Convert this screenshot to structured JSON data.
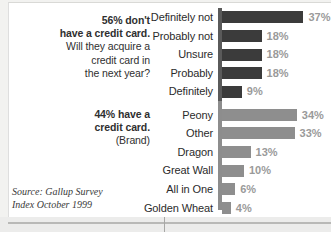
{
  "annotations": {
    "group1_line1": "56% don't",
    "group1_line2": "have a credit card.",
    "group1_line3": "Will they acquire a",
    "group1_line4": "credit card in",
    "group1_line5": "the next year?",
    "group2_line1": "44% have a",
    "group2_line2": "credit card.",
    "group2_line3": "(Brand)"
  },
  "source": {
    "line1": "Source: Gallup Survey",
    "line2": "Index October 1999"
  },
  "colors": {
    "bar_dark": "#3b3b3b",
    "bar_light": "#8e8e8e",
    "axis": "#8d8d8d",
    "value_label": "#9a9a9a",
    "page_background": "#ffffff",
    "surround": "#f2f2f0"
  },
  "chart_data": {
    "type": "bar",
    "orientation": "horizontal",
    "title": "",
    "xlabel": "",
    "ylabel": "",
    "xlim": [
      0,
      40
    ],
    "grid": false,
    "legend": false,
    "value_suffix": "%",
    "groups": [
      {
        "name": "Will they acquire a credit card in the next year?",
        "annotation": "56% don't have a credit card.",
        "series_color": "#3b3b3b",
        "categories": [
          "Definitely not",
          "Probably not",
          "Unsure",
          "Probably",
          "Definitely"
        ],
        "values": [
          37,
          18,
          18,
          18,
          9
        ],
        "labels": [
          "37%",
          "18%",
          "18%",
          "18%",
          "9%"
        ]
      },
      {
        "name": "Brand",
        "annotation": "44% have a credit card.",
        "series_color": "#8e8e8e",
        "categories": [
          "Peony",
          "Other",
          "Dragon",
          "Great Wall",
          "All in One",
          "Golden Wheat"
        ],
        "values": [
          34,
          33,
          13,
          10,
          6,
          4
        ],
        "labels": [
          "34%",
          "33%",
          "13%",
          "10%",
          "6%",
          "4%"
        ]
      }
    ]
  }
}
